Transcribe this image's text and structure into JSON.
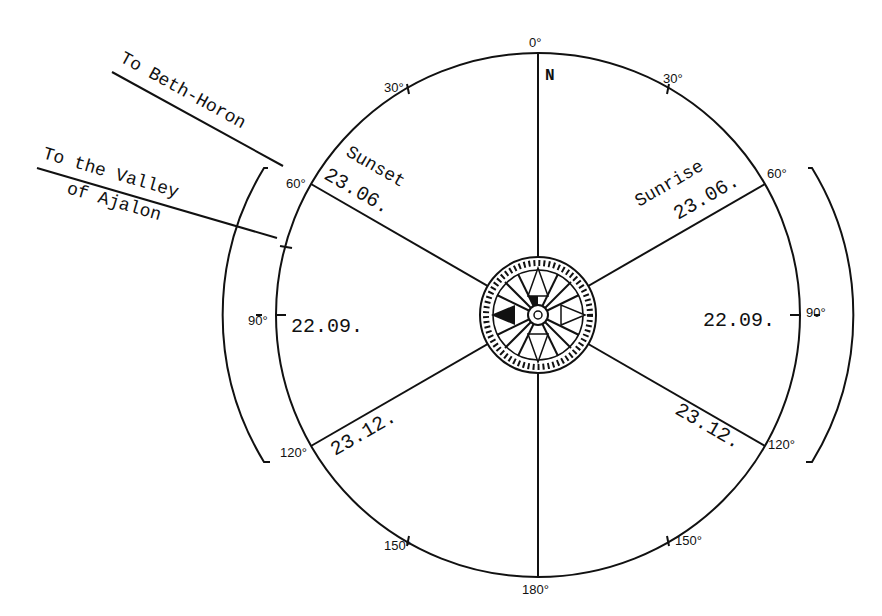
{
  "diagram": {
    "north_label": "N",
    "degree_marks": {
      "d0": "0°",
      "d30_left": "30°",
      "d30_right": "30°",
      "d60_left": "60°",
      "d60_right": "60°",
      "d90_left": "90°",
      "d90_right": "90°",
      "d120_left": "120°",
      "d120_right": "120°",
      "d150_left": "150°",
      "d150_right": "150°",
      "d180": "180°"
    },
    "sunrise": {
      "label": "Sunrise",
      "summer_date": "23.06.",
      "equinox_date": "22.09.",
      "winter_date": "23.12."
    },
    "sunset": {
      "label": "Sunset",
      "summer_date": "23.06.",
      "equinox_date": "22.09.",
      "winter_date": "23.12."
    },
    "directions": {
      "beth_horon": "To Beth-Horon",
      "valley_line1": "To the Valley",
      "valley_line2": "of Ajalon"
    },
    "compass_rose": "compass-rose",
    "colors": {
      "ink": "#111111",
      "background": "#ffffff"
    }
  }
}
